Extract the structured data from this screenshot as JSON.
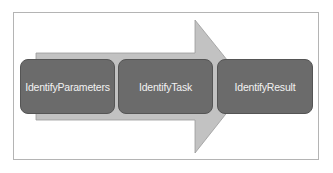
{
  "diagram": {
    "type": "process-arrow",
    "steps": [
      {
        "label": "IdentifyParameters"
      },
      {
        "label": "IdentifyTask"
      },
      {
        "label": "IdentifyResult"
      }
    ],
    "colors": {
      "arrow": "#c2c2c2",
      "box": "#6b6b6b",
      "text": "#f2f2f2",
      "frame": "#b4b4b4"
    }
  }
}
